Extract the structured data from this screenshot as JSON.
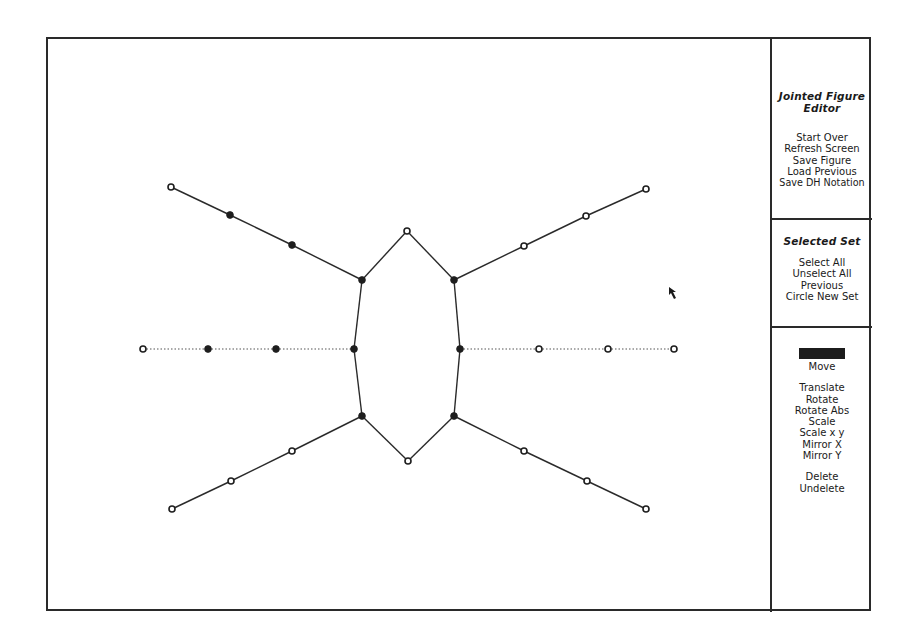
{
  "panel": {
    "title_lines": [
      "Jointed Figure",
      "Editor"
    ],
    "file_menu": [
      {
        "label": "Start Over"
      },
      {
        "label": "Refresh Screen"
      },
      {
        "label": "Save Figure"
      },
      {
        "label": "Load Previous"
      },
      {
        "label": "Save DH Notation"
      }
    ],
    "selected_set": {
      "heading": "Selected Set",
      "items": [
        {
          "label": "Select All"
        },
        {
          "label": "Unselect All"
        },
        {
          "label": "Previous"
        },
        {
          "label": "Circle New Set"
        }
      ]
    },
    "operations": {
      "highlighted_item": {
        "label": "Stretch",
        "state": "selected (rendered as solid black bar)"
      },
      "move": {
        "label": "Move"
      },
      "transform_items": [
        {
          "label": "Translate"
        },
        {
          "label": "Rotate"
        },
        {
          "label": "Rotate Abs"
        },
        {
          "label": "Scale"
        },
        {
          "label": "Scale x y"
        },
        {
          "label": "Mirror X"
        },
        {
          "label": "Mirror Y"
        }
      ],
      "edit_items": [
        {
          "label": "Delete"
        },
        {
          "label": "Undelete"
        }
      ]
    }
  },
  "figure": {
    "colors": {
      "line": "#2a2a2a",
      "joint_filled": "#1e1e1e",
      "joint_hollow_fill": "#ffffff",
      "dotted": "#555555"
    },
    "joints": [
      {
        "id": "UL0",
        "x": 171,
        "y": 187,
        "filled": false
      },
      {
        "id": "UL1",
        "x": 230,
        "y": 215,
        "filled": true
      },
      {
        "id": "UL2",
        "x": 292,
        "y": 245,
        "filled": true
      },
      {
        "id": "UL3",
        "x": 362,
        "y": 280,
        "filled": true
      },
      {
        "id": "TOP",
        "x": 407,
        "y": 231,
        "filled": false
      },
      {
        "id": "UR3",
        "x": 454,
        "y": 280,
        "filled": true
      },
      {
        "id": "UR2",
        "x": 524,
        "y": 246,
        "filled": false
      },
      {
        "id": "UR1",
        "x": 586,
        "y": 216,
        "filled": false
      },
      {
        "id": "UR0",
        "x": 646,
        "y": 189,
        "filled": false
      },
      {
        "id": "ML0",
        "x": 143,
        "y": 349,
        "filled": false
      },
      {
        "id": "ML1",
        "x": 208,
        "y": 349,
        "filled": true
      },
      {
        "id": "ML2",
        "x": 276,
        "y": 349,
        "filled": true
      },
      {
        "id": "ML3",
        "x": 354,
        "y": 349,
        "filled": true
      },
      {
        "id": "MR3",
        "x": 460,
        "y": 349,
        "filled": true
      },
      {
        "id": "MR2",
        "x": 539,
        "y": 349,
        "filled": false
      },
      {
        "id": "MR1",
        "x": 608,
        "y": 349,
        "filled": false
      },
      {
        "id": "MR0",
        "x": 674,
        "y": 349,
        "filled": false
      },
      {
        "id": "LL3",
        "x": 362,
        "y": 416,
        "filled": true
      },
      {
        "id": "LL2",
        "x": 292,
        "y": 451,
        "filled": false
      },
      {
        "id": "LL1",
        "x": 231,
        "y": 481,
        "filled": false
      },
      {
        "id": "LL0",
        "x": 172,
        "y": 509,
        "filled": false
      },
      {
        "id": "BOT",
        "x": 408,
        "y": 461,
        "filled": false
      },
      {
        "id": "LR3",
        "x": 454,
        "y": 416,
        "filled": true
      },
      {
        "id": "LR2",
        "x": 524,
        "y": 451,
        "filled": false
      },
      {
        "id": "LR1",
        "x": 587,
        "y": 481,
        "filled": false
      },
      {
        "id": "LR0",
        "x": 646,
        "y": 509,
        "filled": false
      }
    ],
    "solid_links": [
      [
        "UL0",
        "UL1"
      ],
      [
        "UL1",
        "UL2"
      ],
      [
        "UL2",
        "UL3"
      ],
      [
        "UL3",
        "TOP"
      ],
      [
        "TOP",
        "UR3"
      ],
      [
        "UR3",
        "UR2"
      ],
      [
        "UR2",
        "UR1"
      ],
      [
        "UR1",
        "UR0"
      ],
      [
        "UL3",
        "ML3"
      ],
      [
        "ML3",
        "LL3"
      ],
      [
        "UR3",
        "MR3"
      ],
      [
        "MR3",
        "LR3"
      ],
      [
        "LL3",
        "LL2"
      ],
      [
        "LL2",
        "LL1"
      ],
      [
        "LL1",
        "LL0"
      ],
      [
        "LL3",
        "BOT"
      ],
      [
        "BOT",
        "LR3"
      ],
      [
        "LR3",
        "LR2"
      ],
      [
        "LR2",
        "LR1"
      ],
      [
        "LR1",
        "LR0"
      ]
    ],
    "dotted_links": [
      [
        "ML0",
        "ML1"
      ],
      [
        "ML1",
        "ML2"
      ],
      [
        "ML2",
        "ML3"
      ],
      [
        "MR3",
        "MR2"
      ],
      [
        "MR2",
        "MR1"
      ],
      [
        "MR1",
        "MR0"
      ]
    ]
  },
  "cursor": {
    "type": "arrow-pointer",
    "x": 668,
    "y": 286
  }
}
